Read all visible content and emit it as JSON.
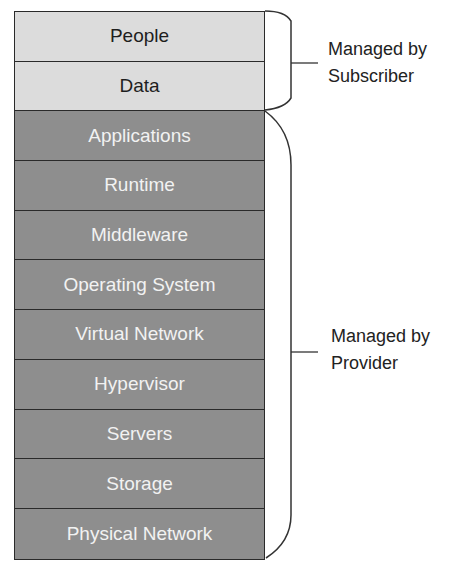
{
  "diagram": {
    "layers": [
      {
        "label": "People",
        "group": "subscriber"
      },
      {
        "label": "Data",
        "group": "subscriber"
      },
      {
        "label": "Applications",
        "group": "provider"
      },
      {
        "label": "Runtime",
        "group": "provider"
      },
      {
        "label": "Middleware",
        "group": "provider"
      },
      {
        "label": "Operating System",
        "group": "provider"
      },
      {
        "label": "Virtual Network",
        "group": "provider"
      },
      {
        "label": "Hypervisor",
        "group": "provider"
      },
      {
        "label": "Servers",
        "group": "provider"
      },
      {
        "label": "Storage",
        "group": "provider"
      },
      {
        "label": "Physical Network",
        "group": "provider"
      }
    ],
    "groups": {
      "subscriber": {
        "line1": "Managed by",
        "line2": "Subscriber",
        "color": "#dcdcdc"
      },
      "provider": {
        "line1": "Managed by",
        "line2": "Provider",
        "color": "#8e8e8e"
      }
    }
  }
}
